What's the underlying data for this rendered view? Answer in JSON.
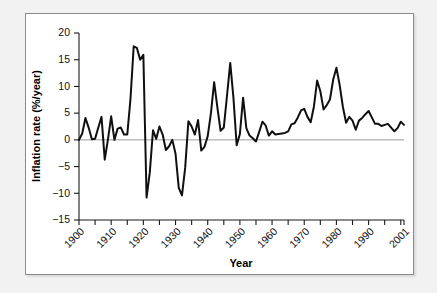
{
  "figure": {
    "background_color": "#f2f2f2",
    "panel_color": "#ffffff",
    "frame_color": "#8a8a8a",
    "line_color": "#101010"
  },
  "chart_data": {
    "type": "line",
    "title": "",
    "xlabel": "Year",
    "ylabel": "Inflation rate (%/year)",
    "xlim": [
      1900,
      2001
    ],
    "ylim": [
      -15,
      20
    ],
    "ytick_labels": [
      "20",
      "15",
      "10",
      "5",
      "0",
      "−5",
      "−10",
      "−15"
    ],
    "ytick_values": [
      20,
      15,
      10,
      5,
      0,
      -5,
      -10,
      -15
    ],
    "xtick_labels": [
      "1900",
      "1910",
      "1920",
      "1930",
      "1940",
      "1950",
      "1960",
      "1970",
      "1980",
      "1990",
      "2001"
    ],
    "xtick_values": [
      1900,
      1910,
      1920,
      1930,
      1940,
      1950,
      1960,
      1970,
      1980,
      1990,
      2001
    ],
    "xminor_step": 5,
    "grid": false,
    "legend": null,
    "zero_reference_line": 0,
    "x": [
      1900,
      1901,
      1902,
      1903,
      1904,
      1905,
      1906,
      1907,
      1908,
      1909,
      1910,
      1911,
      1912,
      1913,
      1914,
      1915,
      1916,
      1917,
      1918,
      1919,
      1920,
      1921,
      1922,
      1923,
      1924,
      1925,
      1926,
      1927,
      1928,
      1929,
      1930,
      1931,
      1932,
      1933,
      1934,
      1935,
      1936,
      1937,
      1938,
      1939,
      1940,
      1941,
      1942,
      1943,
      1944,
      1945,
      1946,
      1947,
      1948,
      1949,
      1950,
      1951,
      1952,
      1953,
      1954,
      1955,
      1956,
      1957,
      1958,
      1959,
      1960,
      1961,
      1962,
      1963,
      1964,
      1965,
      1966,
      1967,
      1968,
      1969,
      1970,
      1971,
      1972,
      1973,
      1974,
      1975,
      1976,
      1977,
      1978,
      1979,
      1980,
      1981,
      1982,
      1983,
      1984,
      1985,
      1986,
      1987,
      1988,
      1989,
      1990,
      1991,
      1992,
      1993,
      1994,
      1995,
      1996,
      1997,
      1998,
      1999,
      2000,
      2001
    ],
    "values": [
      0.0,
      1.2,
      4.1,
      2.3,
      0.1,
      0.2,
      2.3,
      4.3,
      -3.7,
      0.1,
      4.4,
      0.0,
      2.1,
      2.3,
      1.0,
      1.0,
      7.7,
      17.5,
      17.2,
      15.0,
      15.9,
      -10.8,
      -6.1,
      1.8,
      0.2,
      2.5,
      1.0,
      -1.9,
      -1.2,
      0.0,
      -2.6,
      -9.0,
      -10.4,
      -5.2,
      3.5,
      2.5,
      1.0,
      3.7,
      -2.0,
      -1.3,
      0.7,
      5.0,
      10.8,
      6.1,
      1.7,
      2.3,
      8.3,
      14.4,
      7.8,
      -1.0,
      1.1,
      7.9,
      2.2,
      0.8,
      0.3,
      -0.3,
      1.5,
      3.4,
      2.7,
      0.8,
      1.6,
      1.0,
      1.1,
      1.2,
      1.3,
      1.6,
      2.9,
      3.1,
      4.2,
      5.5,
      5.8,
      4.3,
      3.3,
      6.2,
      11.1,
      9.1,
      5.7,
      6.5,
      7.6,
      11.3,
      13.5,
      10.3,
      6.2,
      3.2,
      4.3,
      3.6,
      1.9,
      3.6,
      4.1,
      4.8,
      5.4,
      4.2,
      3.0,
      3.0,
      2.6,
      2.8,
      3.0,
      2.3,
      1.6,
      2.2,
      3.4,
      2.8
    ]
  }
}
